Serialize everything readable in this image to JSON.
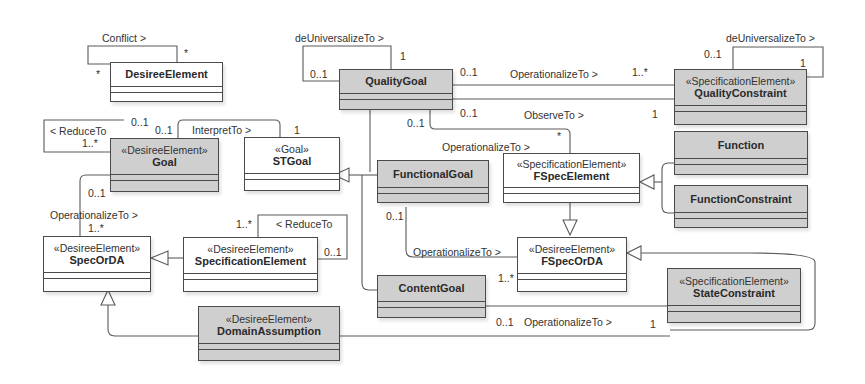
{
  "diagram": {
    "type": "UML class diagram",
    "classes": {
      "desireeElement": {
        "stereotype": "",
        "name": "DesireeElement",
        "fill": "#ffffff"
      },
      "qualityGoal": {
        "stereotype": "",
        "name": "QualityGoal",
        "fill": "#cfcfcf"
      },
      "qualityConstraint": {
        "stereotype": "«SpecificationElement»",
        "name": "QualityConstraint",
        "fill": "#cfcfcf"
      },
      "goal": {
        "stereotype": "«DesireeElement»",
        "name": "Goal",
        "fill": "#cfcfcf"
      },
      "stGoal": {
        "stereotype": "«Goal»",
        "name": "STGoal",
        "fill": "#ffffff"
      },
      "functionalGoal": {
        "stereotype": "",
        "name": "FunctionalGoal",
        "fill": "#cfcfcf"
      },
      "fSpecElement": {
        "stereotype": "«SpecificationElement»",
        "name": "FSpecElement",
        "fill": "#ffffff"
      },
      "function": {
        "stereotype": "",
        "name": "Function",
        "fill": "#cfcfcf"
      },
      "functionConstraint": {
        "stereotype": "",
        "name": "FunctionConstraint",
        "fill": "#cfcfcf"
      },
      "specOrDA": {
        "stereotype": "«DesireeElement»",
        "name": "SpecOrDA",
        "fill": "#ffffff"
      },
      "specificationElement": {
        "stereotype": "«DesireeElement»",
        "name": "SpecificationElement",
        "fill": "#ffffff"
      },
      "fSpecOrDA": {
        "stereotype": "«DesireeElement»",
        "name": "FSpecOrDA",
        "fill": "#ffffff"
      },
      "contentGoal": {
        "stereotype": "",
        "name": "ContentGoal",
        "fill": "#cfcfcf"
      },
      "stateConstraint": {
        "stereotype": "«SpecificationElement»",
        "name": "StateConstraint",
        "fill": "#cfcfcf"
      },
      "domainAssumption": {
        "stereotype": "«DesireeElement»",
        "name": "DomainAssumption",
        "fill": "#cfcfcf"
      }
    },
    "associations": {
      "conflict": {
        "label": "Conflict >",
        "source_mult": "*",
        "target_mult": "*"
      },
      "qgDeUniversalize": {
        "label": "deUniversalizeTo >",
        "source_mult": "0..1",
        "target_mult": "1"
      },
      "qcDeUniversalize": {
        "label": "deUniversalizeTo >",
        "source_mult": "0..1",
        "target_mult": "1"
      },
      "qgOperationalize": {
        "label": "OperationalizeTo >",
        "source_mult": "0..1",
        "target_mult": "1..*"
      },
      "qgObserve": {
        "label": "ObserveTo >",
        "source_mult": "0..1",
        "target_mult": "1"
      },
      "qgOperationalizeFSpec": {
        "label": "OperationalizeTo >",
        "source_mult": "0..1",
        "target_mult": "*"
      },
      "goalReduce": {
        "label": "< ReduceTo",
        "source_mult": "0..1",
        "target_mult": "1..*"
      },
      "goalInterpret": {
        "label": "InterpretTo >",
        "source_mult": "0..1",
        "target_mult": "1"
      },
      "goalOperationalize": {
        "label": "OperationalizeTo >",
        "source_mult": "0..1",
        "target_mult": "1..*"
      },
      "specReduce": {
        "label": "< ReduceTo",
        "source_mult": "0..1",
        "target_mult": "1..*"
      },
      "fgOperationalize": {
        "label": "OperationalizeTo >",
        "source_mult": "0..1",
        "target_mult": "1..*"
      },
      "cgOperationalize": {
        "label": "OperationalizeTo >",
        "source_mult": "0..1",
        "target_mult": "1"
      }
    }
  }
}
